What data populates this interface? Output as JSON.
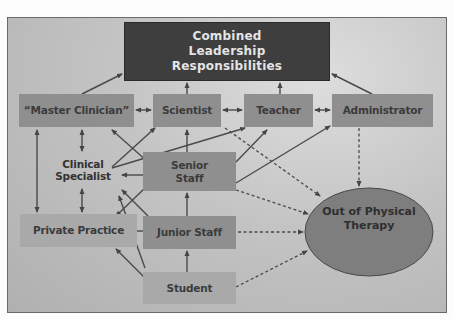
{
  "diagram": {
    "title": "Combined Leadership Responsibilities",
    "nodes": {
      "combined": {
        "label_lines": [
          "Combined",
          "Leadership",
          "Responsibilities"
        ]
      },
      "master_clinician": {
        "label": "“Master Clinician”"
      },
      "scientist": {
        "label": "Scientist"
      },
      "teacher": {
        "label": "Teacher"
      },
      "administrator": {
        "label": "Administrator"
      },
      "clinical_specialist": {
        "label_lines": [
          "Clinical",
          "Specialist"
        ]
      },
      "senior_staff": {
        "label_lines": [
          "Senior",
          "Staff"
        ]
      },
      "private_practice": {
        "label": "Private Practice"
      },
      "junior_staff": {
        "label": "Junior Staff"
      },
      "student": {
        "label": "Student"
      },
      "out_of_pt": {
        "label_lines": [
          "Out of Physical",
          "Therapy"
        ]
      }
    },
    "edges": [
      {
        "from": "master_clinician",
        "to": "combined",
        "style": "solid"
      },
      {
        "from": "scientist",
        "to": "combined",
        "style": "solid"
      },
      {
        "from": "teacher",
        "to": "combined",
        "style": "solid"
      },
      {
        "from": "administrator",
        "to": "combined",
        "style": "solid"
      },
      {
        "from": "master_clinician",
        "to": "scientist",
        "style": "solid",
        "bidirectional": true
      },
      {
        "from": "scientist",
        "to": "teacher",
        "style": "solid",
        "bidirectional": true
      },
      {
        "from": "teacher",
        "to": "administrator",
        "style": "solid",
        "bidirectional": true
      },
      {
        "from": "master_clinician",
        "to": "clinical_specialist",
        "style": "solid",
        "bidirectional": true
      },
      {
        "from": "master_clinician",
        "to": "private_practice",
        "style": "solid",
        "bidirectional": true
      },
      {
        "from": "clinical_specialist",
        "to": "private_practice",
        "style": "solid",
        "bidirectional": true
      },
      {
        "from": "clinical_specialist",
        "to": "scientist",
        "style": "solid"
      },
      {
        "from": "clinical_specialist",
        "to": "teacher",
        "style": "solid"
      },
      {
        "from": "senior_staff",
        "to": "master_clinician",
        "style": "solid"
      },
      {
        "from": "senior_staff",
        "to": "scientist",
        "style": "solid"
      },
      {
        "from": "senior_staff",
        "to": "teacher",
        "style": "solid"
      },
      {
        "from": "senior_staff",
        "to": "administrator",
        "style": "solid"
      },
      {
        "from": "senior_staff",
        "to": "clinical_specialist",
        "style": "solid"
      },
      {
        "from": "senior_staff",
        "to": "private_practice",
        "style": "solid"
      },
      {
        "from": "junior_staff",
        "to": "senior_staff",
        "style": "solid"
      },
      {
        "from": "junior_staff",
        "to": "clinical_specialist",
        "style": "solid"
      },
      {
        "from": "junior_staff",
        "to": "private_practice",
        "style": "solid"
      },
      {
        "from": "student",
        "to": "junior_staff",
        "style": "solid"
      },
      {
        "from": "student",
        "to": "clinical_specialist",
        "style": "solid"
      },
      {
        "from": "student",
        "to": "private_practice",
        "style": "solid"
      },
      {
        "from": "scientist",
        "to": "out_of_pt",
        "style": "dashed"
      },
      {
        "from": "senior_staff",
        "to": "out_of_pt",
        "style": "dashed"
      },
      {
        "from": "administrator",
        "to": "out_of_pt",
        "style": "dashed"
      },
      {
        "from": "junior_staff",
        "to": "out_of_pt",
        "style": "dashed"
      },
      {
        "from": "student",
        "to": "out_of_pt",
        "style": "dashed"
      }
    ],
    "colors": {
      "background": "#bdbdbd",
      "dark_box": "#3e3e3e",
      "mid_box": "#8f8f8f",
      "light_box": "#a9a9a9",
      "ellipse": "#7e7e7e",
      "line": "#4a4a4a"
    }
  }
}
